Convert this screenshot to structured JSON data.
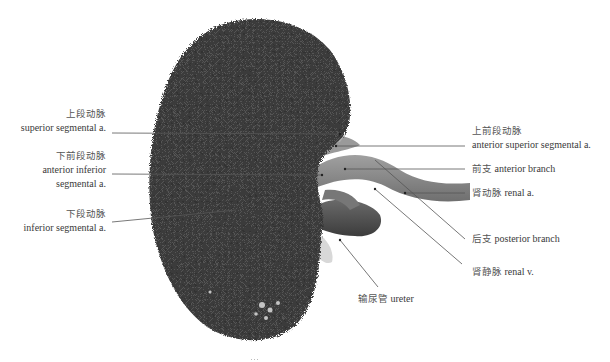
{
  "figure": {
    "caption_partial": "…",
    "colors": {
      "kidney_cast": "#3b3b3b",
      "vessel": "#8a8a8a",
      "leader_line": "#555555",
      "background": "#ffffff"
    }
  },
  "labels": {
    "left": [
      {
        "cn": "上段动脉",
        "en": "superior segmental a."
      },
      {
        "cn": "下前段动脉",
        "en": "anterior inferior",
        "en2": "segmental a."
      },
      {
        "cn": "下段动脉",
        "en": "inferior segmental a."
      }
    ],
    "right": [
      {
        "cn": "上前段动脉",
        "en": "anterior superior segmental a."
      },
      {
        "cn": "前支",
        "en": "anterior branch"
      },
      {
        "cn": "肾动脉",
        "en": "renal a."
      },
      {
        "cn": "后支",
        "en": "posterior branch"
      },
      {
        "cn": "肾静脉",
        "en": "renal v."
      }
    ],
    "bottom": [
      {
        "cn": "输尿管",
        "en": "ureter"
      }
    ]
  }
}
